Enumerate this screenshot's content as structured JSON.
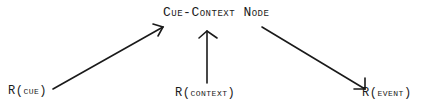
{
  "diagram": {
    "title_node": {
      "label": "Cue-Context Node"
    },
    "inputs": [
      {
        "id": "cue",
        "label": "R(cue)"
      },
      {
        "id": "context",
        "label": "R(context)"
      },
      {
        "id": "event",
        "label": "R(event)"
      }
    ],
    "edges": [
      {
        "from": "R(cue)",
        "to": "Cue-Context Node",
        "direction": "to-node"
      },
      {
        "from": "R(context)",
        "to": "Cue-Context Node",
        "direction": "to-node"
      },
      {
        "from": "Cue-Context Node",
        "to": "R(event)",
        "direction": "from-node"
      }
    ],
    "colors": {
      "ink": "#1a1a1a",
      "background": "#ffffff"
    }
  }
}
